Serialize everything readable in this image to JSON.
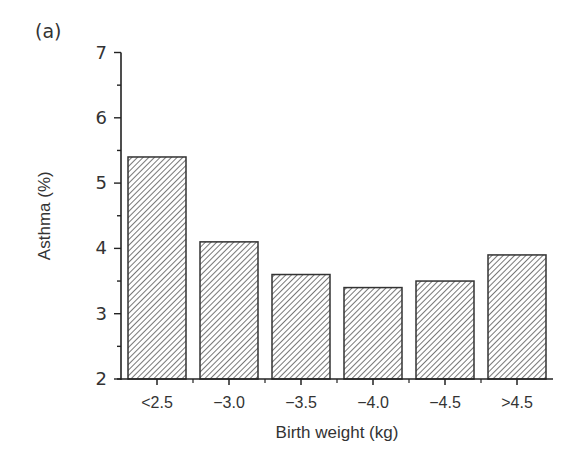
{
  "panel_label": "(a)",
  "chart_data": {
    "type": "bar",
    "title": "",
    "xlabel": "Birth weight (kg)",
    "ylabel": "Asthma (%)",
    "categories": [
      "<2.5",
      "−3.0",
      "−3.5",
      "−4.0",
      "−4.5",
      ">4.5"
    ],
    "values": [
      5.4,
      4.1,
      3.6,
      3.4,
      3.5,
      3.9
    ],
    "ylim": [
      2,
      7
    ],
    "yticks": [
      "2",
      "3",
      "4",
      "5",
      "6",
      "7"
    ],
    "grid": false,
    "legend": null,
    "bar_fill": "diagonal-hatch",
    "colors": {
      "bar_stroke": "#333333",
      "hatch": "#555555",
      "axis": "#222222"
    }
  }
}
